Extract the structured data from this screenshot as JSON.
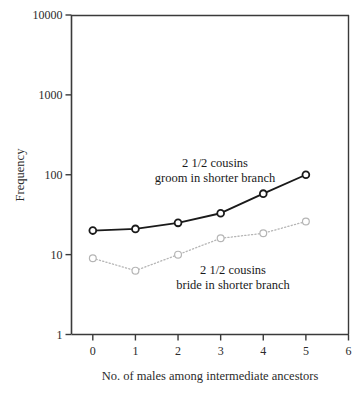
{
  "chart_data": {
    "type": "line",
    "title": "",
    "xlabel": "No. of males among intermediate ancestors",
    "ylabel": "Frequency",
    "yscale": "log",
    "ylim": [
      1,
      10000
    ],
    "xlim": [
      -0.5,
      6
    ],
    "grid": false,
    "legend_position": "inline-annotations",
    "x": [
      0,
      1,
      2,
      3,
      4,
      5
    ],
    "xticklabels": [
      "0",
      "1",
      "2",
      "3",
      "4",
      "5",
      "6"
    ],
    "xticks": [
      0,
      1,
      2,
      3,
      4,
      5,
      6
    ],
    "yticklabels": [
      "10000",
      "1000",
      "100",
      "10",
      "1"
    ],
    "yticks": [
      10000,
      1000,
      100,
      10,
      1
    ],
    "series": [
      {
        "name": "2 1/2 cousins groom in shorter branch",
        "annotation_line1": "2 1/2 cousins",
        "annotation_line2": "groom in shorter branch",
        "style": "solid",
        "color": "#1a1a1a",
        "marker": "open-circle",
        "values": [
          20,
          21,
          25,
          33,
          58,
          100
        ]
      },
      {
        "name": "2 1/2 cousins bride in shorter branch",
        "annotation_line1": "2 1/2 cousins",
        "annotation_line2": "bride in shorter branch",
        "style": "dotted",
        "color": "#b5b5b5",
        "marker": "open-circle",
        "values": [
          9,
          6.3,
          10,
          16,
          18.5,
          26
        ]
      }
    ]
  },
  "axes": {
    "y_label": "Frequency",
    "x_label": "No. of males among intermediate ancestors",
    "y_ticks": [
      "10000",
      "1000",
      "100",
      "10",
      "1"
    ],
    "x_ticks": [
      "0",
      "1",
      "2",
      "3",
      "4",
      "5",
      "6"
    ]
  },
  "annotations": {
    "upper": {
      "line1": "2 1/2 cousins",
      "line2": "groom in shorter branch"
    },
    "lower": {
      "line1": "2 1/2 cousins",
      "line2": "bride in shorter branch"
    }
  },
  "colors": {
    "axis": "#3a3a3a",
    "series_solid": "#1a1a1a",
    "series_dotted": "#b5b5b5",
    "background": "#ffffff"
  }
}
